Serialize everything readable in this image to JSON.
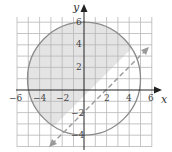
{
  "figure": {
    "axes": {
      "x_label": "x",
      "y_label": "y",
      "x_ticks": [
        "−6",
        "−4",
        "−2",
        "2",
        "4",
        "6"
      ],
      "y_ticks": [
        "6",
        "4",
        "2",
        "−2",
        "−4"
      ]
    },
    "circle": {
      "center": [
        0,
        1
      ],
      "radius": 5,
      "style": "solid",
      "color": "#8a8a8a"
    },
    "line": {
      "equation": "y = x - 2",
      "style": "dashed",
      "arrows": "both",
      "color": "#9a9a9a"
    },
    "shaded_region": "inside circle and above line",
    "colors": {
      "shade": "#e4e4e4",
      "grid": "#b8b8b8",
      "axis": "#222222"
    }
  }
}
